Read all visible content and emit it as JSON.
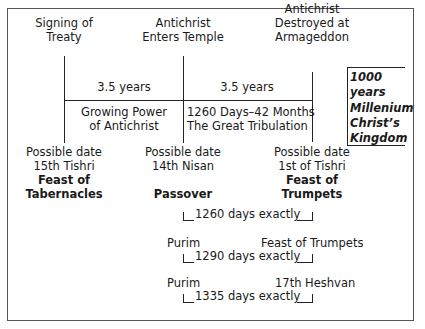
{
  "diagram": {
    "type": "timeline",
    "events": [
      {
        "id": "treaty",
        "line1": "Signing of",
        "line2": "Treaty"
      },
      {
        "id": "temple",
        "line1": "Antichrist",
        "line2": "Enters Temple"
      },
      {
        "id": "armageddon",
        "line1": "Antichrist",
        "line2": "Destroyed at",
        "line3": "Armageddon"
      }
    ],
    "periods": [
      {
        "duration": "3.5 years",
        "desc1": "Growing Power",
        "desc2": "of Antichrist"
      },
      {
        "duration": "3.5 years",
        "desc1": "1260 Days–42 Months",
        "desc2": "The Great Tribulation"
      }
    ],
    "millennium": {
      "line1": "1000",
      "line2": "years",
      "line3": "Millenium",
      "line4": "Christ’s",
      "line5": "Kingdom"
    },
    "dates": [
      {
        "line1": "Possible date",
        "line2": "15th Tishri",
        "feast1": "Feast of",
        "feast2": "Tabernacles"
      },
      {
        "line1": "Possible date",
        "line2": "14th Nisan",
        "feast1": "",
        "feast2": "Passover"
      },
      {
        "line1": "Possible date",
        "line2": "1st of Tishri",
        "feast1": "Feast of",
        "feast2": "Trumpets"
      }
    ],
    "spans": [
      {
        "from": "",
        "to": "",
        "label": "1260 days exactly"
      },
      {
        "from": "Purim",
        "to": "Feast of Trumpets",
        "label": "1290 days exactly"
      },
      {
        "from": "Purim",
        "to": "17th Heshvan",
        "label": "1335 days exactly"
      }
    ]
  }
}
